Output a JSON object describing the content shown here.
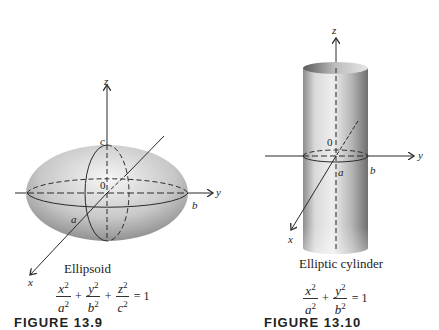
{
  "figures": {
    "ellipsoid": {
      "axis_labels": {
        "x": "x",
        "y": "y",
        "z": "z"
      },
      "intercept_labels": {
        "a": "a",
        "b": "b",
        "c": "c"
      },
      "origin_label": "0",
      "caption": "Ellipsoid",
      "equation": {
        "terms": [
          {
            "numerator": "x",
            "denominator": "a",
            "exponent": "2"
          },
          {
            "numerator": "y",
            "denominator": "b",
            "exponent": "2"
          },
          {
            "numerator": "z",
            "denominator": "c",
            "exponent": "2"
          }
        ],
        "plus": "+",
        "equals": "= 1"
      },
      "figure_label": "FIGURE 13.9"
    },
    "elliptic_cylinder": {
      "axis_labels": {
        "x": "x",
        "y": "y",
        "z": "z"
      },
      "intercept_labels": {
        "a": "a",
        "b": "b"
      },
      "origin_label": "0",
      "caption": "Elliptic cylinder",
      "equation": {
        "terms": [
          {
            "numerator": "x",
            "denominator": "a",
            "exponent": "2"
          },
          {
            "numerator": "y",
            "denominator": "b",
            "exponent": "2"
          }
        ],
        "plus": "+",
        "equals": "= 1"
      },
      "figure_label": "FIGURE 13.10"
    }
  },
  "colors": {
    "surface_light": "#efefef",
    "surface_dark": "#8a8a8a",
    "line": "#2a2a2a"
  }
}
